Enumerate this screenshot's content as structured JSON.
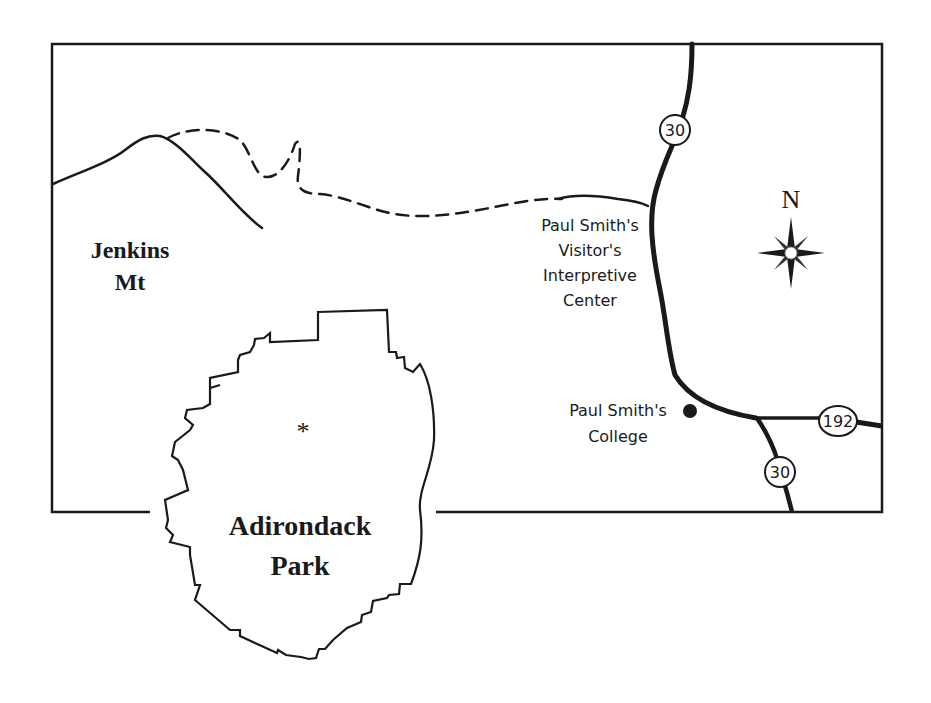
{
  "map": {
    "labels": {
      "jenkins_line1": "Jenkins",
      "jenkins_line2": "Mt",
      "visitor_line1": "Paul Smith's",
      "visitor_line2": "Visitor's",
      "visitor_line3": "Interpretive",
      "visitor_line4": "Center",
      "college_line1": "Paul Smith's",
      "college_line2": "College",
      "park_line1": "Adirondack",
      "park_line2": "Park",
      "park_marker": "*",
      "compass_north": "N"
    },
    "routes": {
      "route_30_north": "30",
      "route_30_south": "30",
      "route_192": "192"
    },
    "icons": {
      "compass": "compass-rose-icon",
      "college_marker": "filled-circle-icon",
      "location_marker": "asterisk-icon"
    },
    "colors": {
      "ink": "#1a1a1a",
      "background": "#ffffff"
    }
  }
}
